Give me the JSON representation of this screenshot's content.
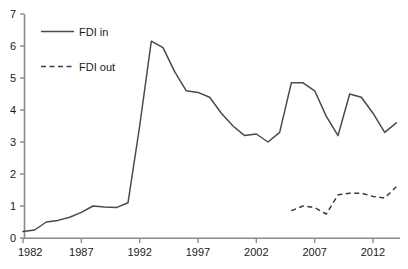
{
  "chart_data": {
    "type": "line",
    "title": "",
    "xlabel": "",
    "ylabel": "",
    "xlim": [
      1982,
      2014
    ],
    "ylim": [
      0,
      7
    ],
    "grid": false,
    "legend_position": "top-left",
    "x_tick_labels": [
      "1982",
      "1987",
      "1992",
      "1997",
      "2002",
      "2007",
      "2012"
    ],
    "x_ticks": [
      1982,
      1987,
      1992,
      1997,
      2002,
      2007,
      2012
    ],
    "y_tick_labels": [
      "0",
      "1",
      "2",
      "3",
      "4",
      "5",
      "6",
      "7"
    ],
    "y_ticks": [
      0,
      1,
      2,
      3,
      4,
      5,
      6,
      7
    ],
    "series": [
      {
        "name": "FDI in",
        "style": "solid",
        "color": "#4a4a4a",
        "x": [
          1982,
          1983,
          1984,
          1985,
          1986,
          1987,
          1988,
          1989,
          1990,
          1991,
          1992,
          1993,
          1994,
          1995,
          1996,
          1997,
          1998,
          1999,
          2000,
          2001,
          2002,
          2003,
          2004,
          2005,
          2006,
          2007,
          2008,
          2009,
          2010,
          2011,
          2012,
          2013,
          2014
        ],
        "values": [
          0.2,
          0.25,
          0.5,
          0.55,
          0.65,
          0.8,
          1.0,
          0.97,
          0.95,
          1.1,
          3.5,
          6.15,
          5.95,
          5.2,
          4.6,
          4.55,
          4.4,
          3.9,
          3.5,
          3.2,
          3.25,
          3.0,
          3.3,
          4.85,
          4.85,
          4.6,
          3.8,
          3.2,
          4.5,
          4.4,
          3.9,
          3.3,
          3.6
        ]
      },
      {
        "name": "FDI out",
        "style": "dashed",
        "color": "#3c3c3c",
        "x": [
          2005,
          2006,
          2007,
          2008,
          2009,
          2010,
          2011,
          2012,
          2013,
          2014
        ],
        "values": [
          0.85,
          1.0,
          0.95,
          0.75,
          1.35,
          1.4,
          1.4,
          1.3,
          1.25,
          1.6
        ]
      }
    ]
  },
  "legend": {
    "entries": [
      {
        "label": "FDI in",
        "style": "solid"
      },
      {
        "label": "FDI out",
        "style": "dashed"
      }
    ]
  },
  "colors": {
    "axis": "#8a8a8a",
    "text": "#1a1a1a",
    "series_in": "#4a4a4a",
    "series_out": "#3c3c3c",
    "background": "#ffffff"
  }
}
